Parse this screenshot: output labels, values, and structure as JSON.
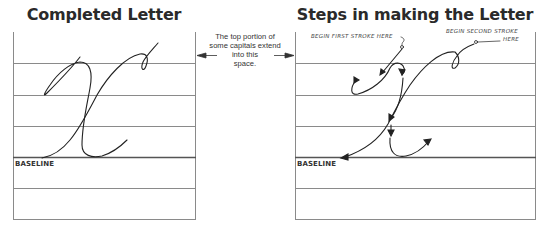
{
  "panels": {
    "left": {
      "title": "Completed Letter",
      "baseline_label": "BASELINE"
    },
    "right": {
      "title": "Steps in making the Letter",
      "baseline_label": "BASELINE",
      "annotations": {
        "first_stroke": "BEGIN FIRST STROKE HERE",
        "second_stroke_line1": "BEGIN SECOND STROKE",
        "second_stroke_line2": "HERE"
      }
    }
  },
  "middle_note": {
    "line1": "The top portion of",
    "line2": "some capitals extend",
    "line3": "into this space."
  },
  "letter": "X (cursive capital)",
  "colors": {
    "ink": "#2a2a2a",
    "rule_lines": "#8a8a8a",
    "background": "#ffffff"
  }
}
